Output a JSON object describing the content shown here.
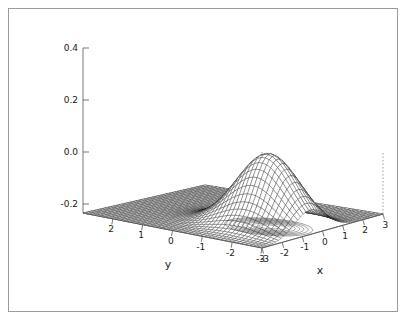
{
  "figure": {
    "background_color": "#ffffff",
    "frame_color": "#9a9a9a",
    "ink_color": "#1a1a1a"
  },
  "chart_data": {
    "type": "surface",
    "title": "",
    "subtitle": "",
    "function": "bivariate gaussian density peak",
    "xlabel": "x",
    "ylabel": "y",
    "zlabel": "",
    "xlim": [
      -3,
      3
    ],
    "ylim": [
      -3,
      3
    ],
    "zlim": [
      -0.2,
      0.4
    ],
    "x_ticks": [
      -3,
      -2,
      -1,
      0,
      1,
      2,
      3
    ],
    "x_tick_labels": [
      "-3",
      "-2",
      "-1",
      "0",
      "1",
      "2",
      "3"
    ],
    "y_ticks": [
      2,
      1,
      0,
      -1,
      -2,
      -3
    ],
    "y_tick_labels": [
      "2",
      "1",
      "0",
      "-1",
      "-2",
      "-3"
    ],
    "z_ticks": [
      -0.2,
      0.0,
      0.2,
      0.4
    ],
    "z_tick_labels": [
      "-0.2",
      "0.0",
      "0.2",
      "0.4"
    ],
    "peak": {
      "x": -0.6,
      "y": -1.6,
      "z": 0.24
    },
    "z_max": 0.24,
    "z_min": 0.0,
    "grid": false,
    "legend": false,
    "mesh_lines_u": 45,
    "mesh_lines_v": 45,
    "contour_levels": 12,
    "projection": {
      "azimuth": -35,
      "elevation": 22
    }
  },
  "axes": {
    "z_axis": {
      "name": "z-axis",
      "ticks": [
        "0.4",
        "0.2",
        "0.0",
        "-0.2"
      ]
    },
    "y_axis": {
      "name": "y-axis",
      "title": "y",
      "ticks": [
        "2",
        "1",
        "0",
        "-1",
        "-2",
        "-3"
      ]
    },
    "x_axis": {
      "name": "x-axis",
      "title": "x",
      "ticks": [
        "-3",
        "-2",
        "-1",
        "0",
        "1",
        "2",
        "3"
      ]
    }
  }
}
